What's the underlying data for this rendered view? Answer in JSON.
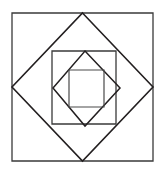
{
  "figure": {
    "canvas": {
      "width": 164,
      "height": 174,
      "background_color": "#ffffff"
    },
    "style": {
      "stroke_color": "#231f20",
      "stroke_color_light": "#4a4a4a",
      "fill": "none",
      "stroke_width_outer": 1.3,
      "stroke_width_diamond": 1.5,
      "stroke_width_inner": 1.2
    },
    "shapes": [
      {
        "name": "outer-square",
        "type": "square",
        "orientation": "axis-aligned",
        "points": "12,13 153,13 153,161 12,161",
        "center": [
          82.5,
          87
        ],
        "side_length": 141,
        "stroke_color": "#3a3a3a",
        "stroke_width": 1.3,
        "level": 1
      },
      {
        "name": "outer-diamond",
        "type": "square",
        "orientation": "rotated-45",
        "points": "82.5,13 153,87 82.5,161 12,87",
        "center": [
          82.5,
          87
        ],
        "stroke_color": "#231f20",
        "stroke_width": 1.6,
        "level": 2
      },
      {
        "name": "middle-square",
        "type": "square",
        "orientation": "axis-aligned",
        "points": "52,51 116,51 116,124 52,124",
        "center": [
          84,
          87.5
        ],
        "side_length": 70,
        "stroke_color": "#3a3a3a",
        "stroke_width": 1.3,
        "level": 3
      },
      {
        "name": "inner-diamond",
        "type": "square",
        "orientation": "rotated-45",
        "points": "85,51 120,88 85,126 53,88",
        "center": [
          84.5,
          88
        ],
        "stroke_color": "#231f20",
        "stroke_width": 1.5,
        "level": 4
      },
      {
        "name": "inner-square",
        "type": "square",
        "orientation": "axis-aligned",
        "points": "69,70 104,70 104,107 69,107",
        "center": [
          86.5,
          88.5
        ],
        "side_length": 36,
        "stroke_color": "#4a4a4a",
        "stroke_width": 1.2,
        "level": 5
      }
    ],
    "shape_count": 5
  }
}
